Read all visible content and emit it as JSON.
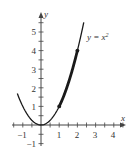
{
  "chart_data": {
    "type": "line",
    "title": "",
    "xlabel": "x",
    "ylabel": "y",
    "xlim": [
      -1.3,
      4.6
    ],
    "ylim": [
      -1.4,
      6.1
    ],
    "x_ticks": [
      -1,
      1,
      2,
      3,
      4
    ],
    "y_ticks": [
      -1,
      1,
      2,
      3,
      4,
      5
    ],
    "x_tick_labels": [
      "−1",
      "1",
      "2",
      "3",
      "4"
    ],
    "y_tick_labels": [
      "−1",
      "1",
      "2",
      "3",
      "4",
      "5"
    ],
    "grid": false,
    "legend": null,
    "series": [
      {
        "name": "y = x²",
        "function": "x^2",
        "x_range": [
          -1.3,
          2.35
        ],
        "x": [
          -1.3,
          -1,
          -0.5,
          0,
          0.5,
          1,
          1.5,
          2,
          2.35
        ],
        "values": [
          1.69,
          1,
          0.25,
          0,
          0.25,
          1,
          2.25,
          4,
          5.52
        ]
      }
    ],
    "highlighted_segment": {
      "x_range": [
        1,
        2
      ],
      "style": "thick"
    },
    "points": [
      {
        "x": 1,
        "y": 1
      },
      {
        "x": 2,
        "y": 4
      }
    ],
    "annotations": [
      {
        "text": "y = x²",
        "x": 2.55,
        "y": 5.1
      }
    ]
  },
  "labels": {
    "curve": "y = x",
    "curve_exp": "2",
    "x_axis": "x",
    "y_axis": "y",
    "x_ticks": [
      "−1",
      "1",
      "2",
      "3",
      "4"
    ],
    "y_ticks": [
      "−1",
      "1",
      "2",
      "3",
      "4",
      "5"
    ]
  },
  "colors": {
    "curve": "#1a1a1a",
    "axis": "#444444",
    "text": "#333333"
  }
}
